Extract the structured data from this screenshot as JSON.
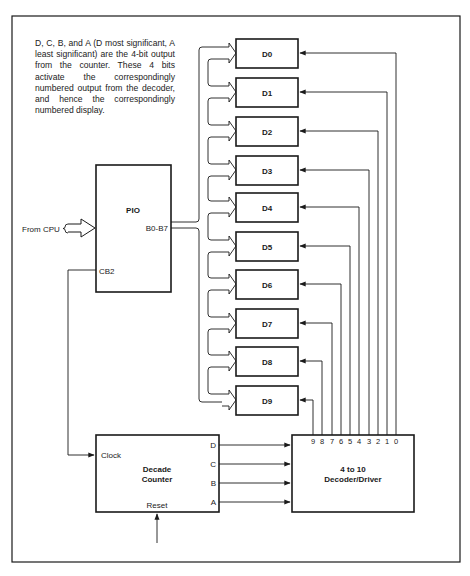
{
  "note": {
    "text": "D, C, B, and A (D most significant, A least significant) are the 4-bit output from the counter. These 4 bits activate the correspondingly numbered output from the decoder, and hence the correspondingly numbered display."
  },
  "pio": {
    "title": "PIO",
    "port_label": "B0-B7",
    "cb2_label": "CB2",
    "input_label": "From CPU"
  },
  "displays": [
    {
      "label": "D0"
    },
    {
      "label": "D1"
    },
    {
      "label": "D2"
    },
    {
      "label": "D3"
    },
    {
      "label": "D4"
    },
    {
      "label": "D5"
    },
    {
      "label": "D6"
    },
    {
      "label": "D7"
    },
    {
      "label": "D8"
    },
    {
      "label": "D9"
    }
  ],
  "counter": {
    "title_line1": "Decade",
    "title_line2": "Counter",
    "clock_label": "Clock",
    "reset_label": "Reset",
    "outputs": [
      "D",
      "C",
      "B",
      "A"
    ]
  },
  "decoder": {
    "title_line1": "4 to 10",
    "title_line2": "Decoder/Driver",
    "pins": [
      "9",
      "8",
      "7",
      "6",
      "5",
      "4",
      "3",
      "2",
      "1",
      "0"
    ]
  },
  "colors": {
    "line": "#1a1a1a",
    "background": "#ffffff"
  }
}
